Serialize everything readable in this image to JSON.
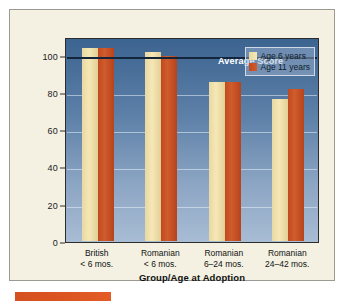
{
  "chart_data": {
    "type": "bar",
    "title": "",
    "xlabel": "Group/Age at Adoption",
    "ylabel": "Mean Intelligence Test Score",
    "categories": [
      "British\n< 6 mos.",
      "Romanian\n< 6 mos.",
      "Romanian\n6–24 mos.",
      "Romanian\n24–42 mos."
    ],
    "category_lines": [
      [
        "British",
        "< 6 mos."
      ],
      [
        "Romanian",
        "< 6 mos."
      ],
      [
        "Romanian",
        "6–24 mos."
      ],
      [
        "Romanian",
        "24–42 mos."
      ]
    ],
    "series": [
      {
        "name": "Age 6 years",
        "color": "#f0dda0",
        "values": [
          104,
          102,
          86,
          77
        ]
      },
      {
        "name": "Age 11 years",
        "color": "#c8502a",
        "values": [
          104,
          100,
          86,
          82
        ]
      }
    ],
    "ylim": [
      0,
      110
    ],
    "yticks": [
      0,
      20,
      40,
      60,
      80,
      100
    ],
    "ytick_labels": [
      "0",
      "20",
      "40",
      "60",
      "80",
      "100"
    ],
    "grid": true,
    "legend_position": "top-right",
    "annotations": [
      {
        "name": "average-score",
        "text": "Average Score",
        "value": 100
      }
    ],
    "reference_line": {
      "label": "Average Score",
      "value": 100,
      "color": "#12253a"
    }
  },
  "legend": {
    "items": [
      {
        "label": "Age 6 years"
      },
      {
        "label": "Age 11 years"
      }
    ]
  },
  "axes": {
    "y_title": "Mean Intelligence Test Score",
    "x_title": "Group/Age at Adoption"
  },
  "colors": {
    "series_1": "#f0dda0",
    "series_2": "#c8502a",
    "plot_background_top": "#3c6490",
    "plot_background_bottom": "#a8bcd4",
    "panel_background": "#f4f1e3",
    "accent_bar": "#d4501e"
  }
}
